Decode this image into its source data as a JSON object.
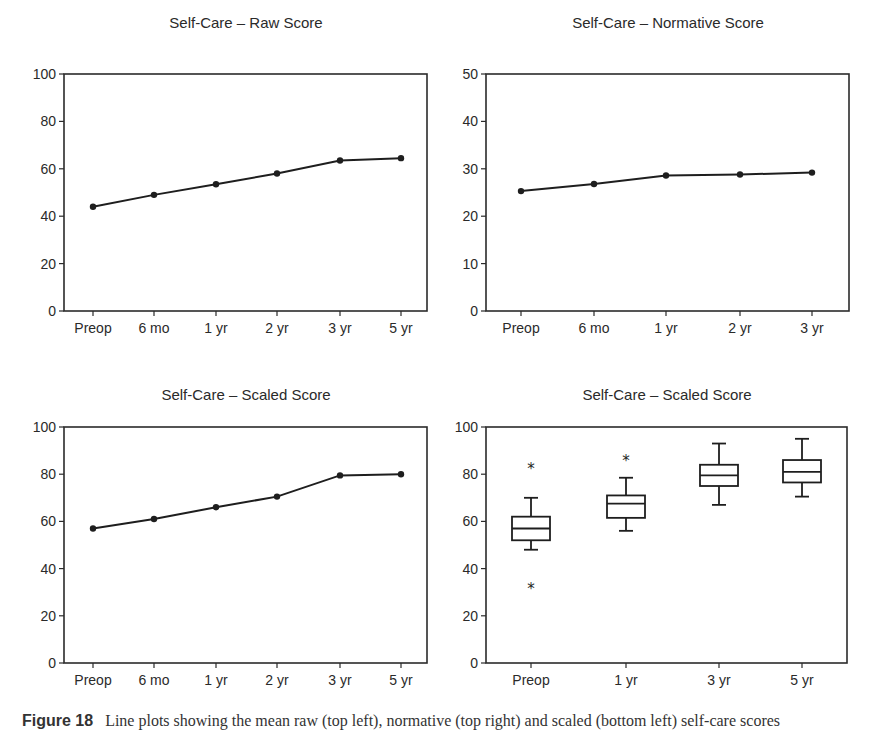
{
  "figure": {
    "caption_label": "Figure 18",
    "caption_text": "Line plots showing the mean raw (top left), normative (top right) and scaled (bottom left) self-care scores"
  },
  "chart_data": [
    {
      "id": "raw",
      "type": "line",
      "title": "Self-Care – Raw Score",
      "categories": [
        "Preop",
        "6 mo",
        "1 yr",
        "2 yr",
        "3 yr",
        "5 yr"
      ],
      "values": [
        44,
        49,
        53.5,
        58,
        63.5,
        64.5
      ],
      "xlabel": "",
      "ylabel": "",
      "ylim": [
        0,
        100
      ],
      "yticks": [
        0,
        20,
        40,
        60,
        80,
        100
      ],
      "grid": false
    },
    {
      "id": "normative",
      "type": "line",
      "title": "Self-Care – Normative Score",
      "categories": [
        "Preop",
        "6 mo",
        "1 yr",
        "2 yr",
        "3 yr"
      ],
      "values": [
        25.3,
        26.8,
        28.6,
        28.8,
        29.2
      ],
      "xlabel": "",
      "ylabel": "",
      "ylim": [
        0,
        50
      ],
      "yticks": [
        0,
        10,
        20,
        30,
        40,
        50
      ],
      "grid": false
    },
    {
      "id": "scaled-line",
      "type": "line",
      "title": "Self-Care – Scaled Score",
      "categories": [
        "Preop",
        "6 mo",
        "1 yr",
        "2 yr",
        "3 yr",
        "5 yr"
      ],
      "values": [
        57,
        61,
        66,
        70.5,
        79.5,
        80
      ],
      "xlabel": "",
      "ylabel": "",
      "ylim": [
        0,
        100
      ],
      "yticks": [
        0,
        20,
        40,
        60,
        80,
        100
      ],
      "grid": false
    },
    {
      "id": "scaled-box",
      "type": "box",
      "title": "Self-Care – Scaled Score",
      "categories": [
        "Preop",
        "1 yr",
        "3 yr",
        "5 yr"
      ],
      "boxes": [
        {
          "whisker_low": 48,
          "q1": 52,
          "median": 57,
          "q3": 62,
          "whisker_high": 70,
          "outliers": [
            83,
            32
          ]
        },
        {
          "whisker_low": 56,
          "q1": 61.5,
          "median": 67.5,
          "q3": 71,
          "whisker_high": 78.5,
          "outliers": [
            86.5
          ]
        },
        {
          "whisker_low": 67,
          "q1": 75,
          "median": 79.5,
          "q3": 84,
          "whisker_high": 93,
          "outliers": []
        },
        {
          "whisker_low": 70.5,
          "q1": 76.5,
          "median": 81,
          "q3": 86,
          "whisker_high": 95,
          "outliers": []
        }
      ],
      "xlabel": "",
      "ylabel": "",
      "ylim": [
        0,
        100
      ],
      "yticks": [
        0,
        20,
        40,
        60,
        80,
        100
      ],
      "grid": false
    }
  ],
  "style": {
    "line_color": "#1e1e1e",
    "axis_color": "#2b2b2b",
    "background": "#ffffff"
  }
}
